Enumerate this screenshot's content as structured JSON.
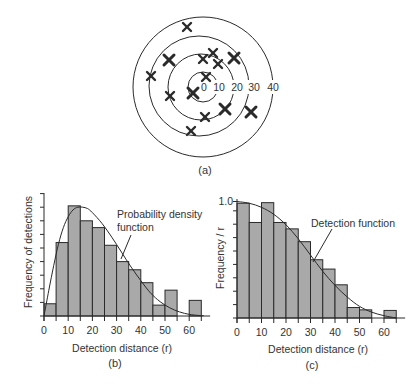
{
  "figure": {
    "panel_labels": {
      "a": "(a)",
      "b": "(b)",
      "c": "(c)"
    },
    "colors": {
      "ink": "#2a2a2a",
      "bar_fill": "#a9a9a9",
      "background": "#ffffff"
    }
  },
  "target_diagram": {
    "ring_labels": [
      "0",
      "10",
      "20",
      "30",
      "40"
    ],
    "ring_distances": [
      10,
      20,
      30,
      40
    ],
    "marker_symbol": "x",
    "detection_count": 14,
    "detections": [
      {
        "dx": -16,
        "dy": -60,
        "bold": false
      },
      {
        "dx": -34,
        "dy": -27,
        "bold": true
      },
      {
        "dx": -52,
        "dy": -11,
        "bold": false
      },
      {
        "dx": 0,
        "dy": -28,
        "bold": false
      },
      {
        "dx": 10,
        "dy": -34,
        "bold": false
      },
      {
        "dx": 15,
        "dy": -23,
        "bold": false
      },
      {
        "dx": 31,
        "dy": -29,
        "bold": true
      },
      {
        "dx": 3,
        "dy": -10,
        "bold": false
      },
      {
        "dx": -10,
        "dy": 6,
        "bold": true
      },
      {
        "dx": -33,
        "dy": 9,
        "bold": false
      },
      {
        "dx": 22,
        "dy": 22,
        "bold": true
      },
      {
        "dx": 2,
        "dy": 30,
        "bold": false
      },
      {
        "dx": 48,
        "dy": 25,
        "bold": true
      },
      {
        "dx": -12,
        "dy": 44,
        "bold": false
      }
    ]
  },
  "chart_data": [
    {
      "id": "b",
      "type": "bar",
      "title": "",
      "xlabel": "Detection distance (r)",
      "ylabel": "Frequency of detections",
      "x_ticks": [
        0,
        10,
        20,
        30,
        40,
        50,
        60
      ],
      "x_tick_labels": [
        "0",
        "10",
        "20",
        "30",
        "40",
        "50",
        "60"
      ],
      "xlim": [
        0,
        67
      ],
      "ylim": [
        0,
        9
      ],
      "y_ticks": [
        1,
        2,
        3,
        4,
        5,
        6,
        7,
        8,
        9
      ],
      "y_tick_labels": [],
      "bin_width": 5,
      "bins": [
        0,
        5,
        10,
        15,
        20,
        25,
        30,
        35,
        40,
        45,
        50,
        55,
        60
      ],
      "values": [
        0.9,
        5.4,
        8.1,
        7.0,
        6.5,
        5.2,
        4.0,
        3.4,
        2.45,
        0.8,
        1.9,
        0,
        1.15
      ],
      "curve": {
        "name": "Probability density function",
        "x": [
          0,
          2,
          4,
          6,
          8,
          10,
          12,
          14,
          16,
          18,
          20,
          24,
          28,
          32,
          36,
          40,
          44,
          48,
          52,
          56,
          60,
          64,
          66
        ],
        "y": [
          0,
          1.9,
          3.7,
          5.3,
          6.5,
          7.3,
          7.8,
          8.0,
          8.0,
          7.9,
          7.6,
          6.8,
          5.8,
          4.7,
          3.6,
          2.6,
          1.7,
          1.05,
          0.6,
          0.3,
          0.12,
          0.04,
          0.02
        ]
      },
      "annotation": {
        "lines": [
          "Probability density",
          "function"
        ]
      },
      "grid": false,
      "legend": "none"
    },
    {
      "id": "c",
      "type": "bar",
      "title": "",
      "xlabel": "Detection distance (r)",
      "ylabel": "Frequency / r",
      "x_ticks": [
        0,
        10,
        20,
        30,
        40,
        50,
        60
      ],
      "x_tick_labels": [
        "0",
        "10",
        "20",
        "30",
        "40",
        "50",
        "60"
      ],
      "xlim": [
        0,
        67
      ],
      "ylim": [
        0,
        1.0
      ],
      "y_ticks": [
        0.115,
        0.23,
        0.345,
        0.46,
        0.575,
        0.69,
        0.805,
        0.92
      ],
      "y_tick_labels": [
        {
          "value": 1.0,
          "label": "1.0"
        }
      ],
      "bin_width": 5,
      "bins": [
        0,
        5,
        10,
        15,
        20,
        25,
        30,
        35,
        40,
        45,
        50,
        55,
        60
      ],
      "values": [
        0.985,
        0.82,
        0.99,
        0.82,
        0.765,
        0.655,
        0.5,
        0.42,
        0.285,
        0.09,
        0.07,
        0,
        0.065
      ],
      "curve": {
        "name": "Detection function",
        "x": [
          0,
          5,
          10,
          15,
          20,
          25,
          30,
          35,
          40,
          45,
          50,
          55,
          60,
          65
        ],
        "y": [
          1.0,
          0.985,
          0.95,
          0.89,
          0.8,
          0.68,
          0.54,
          0.4,
          0.28,
          0.18,
          0.1,
          0.05,
          0.02,
          0.0
        ]
      },
      "annotation": {
        "lines": [
          "Detection function"
        ]
      },
      "grid": false,
      "legend": "none"
    }
  ]
}
